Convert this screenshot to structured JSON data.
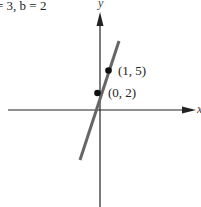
{
  "caption": "= 3, b = 2",
  "axes": {
    "x_label": "x",
    "y_label": "y"
  },
  "points": [
    {
      "label": "(0, 2)",
      "x": 0,
      "y": 2
    },
    {
      "label": "(1, 5)",
      "x": 1,
      "y": 5
    }
  ],
  "line": {
    "slope": 3,
    "intercept": 2,
    "color": "#666666"
  },
  "colors": {
    "axis": "#222222",
    "point": "#111111"
  }
}
